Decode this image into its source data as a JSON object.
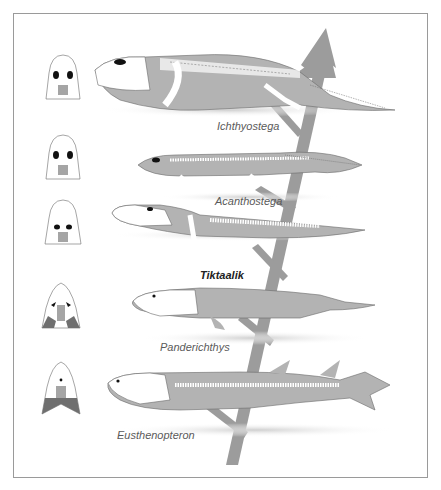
{
  "figure": {
    "colors": {
      "body": "#b3b3b3",
      "arrow": "#9a9a9a",
      "skull_dark": "#6f6f6f",
      "skull_mid": "#a5a5a5",
      "outline": "#6a6a6a",
      "frame": "#9a9a9a"
    },
    "taxa": [
      {
        "name": "Ichthyostega",
        "emphasis": false
      },
      {
        "name": "Acanthostega",
        "emphasis": false
      },
      {
        "name": "Tiktaalik",
        "emphasis": true
      },
      {
        "name": "Panderichthys",
        "emphasis": false
      },
      {
        "name": "Eusthenopteron",
        "emphasis": false
      }
    ],
    "icons": {
      "arrow": "evolution-arrow-icon",
      "skull": "skull-roof-icon"
    }
  }
}
